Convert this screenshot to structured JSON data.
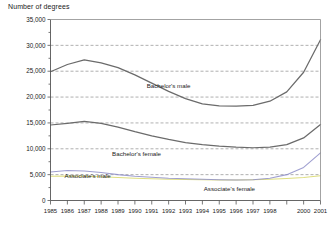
{
  "chart_data": {
    "type": "line",
    "title": "",
    "ylabel": "Number of degrees",
    "xlabel": "",
    "ylim": [
      0,
      35000
    ],
    "ytick_values": [
      0,
      5000,
      10000,
      15000,
      20000,
      25000,
      30000,
      35000
    ],
    "ytick_labels": [
      "0",
      "5,000",
      "10,000",
      "15,000",
      "20,000",
      "25,000",
      "30,000",
      "35,000"
    ],
    "grid": true,
    "grid_axis": "y",
    "legend": "inline-annotations",
    "categories": [
      1985,
      1986,
      1987,
      1988,
      1989,
      1990,
      1991,
      1992,
      1993,
      1994,
      1995,
      1996,
      1997,
      1998,
      1999,
      2000,
      2001
    ],
    "xtick_labels": [
      "1985",
      "1986",
      "1987",
      "1988",
      "1989",
      "1990",
      "1991",
      "1992",
      "1993",
      "1994",
      "1995",
      "1996",
      "1997",
      "1998",
      "1999",
      "2000",
      "2001"
    ],
    "series": [
      {
        "name": "Bachelor's male",
        "color": "#6b6b6b",
        "label_text": "Bachelor's male",
        "values": [
          24900,
          26300,
          27200,
          26600,
          25700,
          24300,
          22700,
          21100,
          19700,
          18700,
          18300,
          18250,
          18400,
          19200,
          21000,
          24800,
          31100
        ]
      },
      {
        "name": "Bachelor's female",
        "color": "#6b6b6b",
        "label_text": "Bachelor's female",
        "values": [
          14600,
          14900,
          15300,
          14900,
          14200,
          13300,
          12500,
          11800,
          11200,
          10800,
          10500,
          10300,
          10200,
          10300,
          10800,
          12100,
          14700
        ]
      },
      {
        "name": "Associate's male",
        "color": "#8e8ec8",
        "label_text": "Associate's male",
        "values": [
          5500,
          5800,
          5700,
          5400,
          5000,
          4700,
          4500,
          4300,
          4200,
          4100,
          4000,
          3950,
          4000,
          4300,
          5000,
          6400,
          9200
        ]
      },
      {
        "name": "Associate's female",
        "color": "#d8d86a",
        "label_text": "Associate's female",
        "values": [
          4700,
          4750,
          4700,
          4600,
          4450,
          4300,
          4200,
          4100,
          4050,
          4000,
          3950,
          3950,
          4000,
          4100,
          4250,
          4450,
          4800
        ]
      }
    ],
    "annotations": [
      {
        "text": "Bachelor's male",
        "x": 1992.0,
        "y": 21800
      },
      {
        "text": "Bachelor's female",
        "x": 1990.1,
        "y": 8600
      },
      {
        "text": "Associate's male",
        "x": 1987.2,
        "y": 4400
      },
      {
        "text": "Associate's female",
        "x": 1995.6,
        "y": 1900
      }
    ]
  }
}
